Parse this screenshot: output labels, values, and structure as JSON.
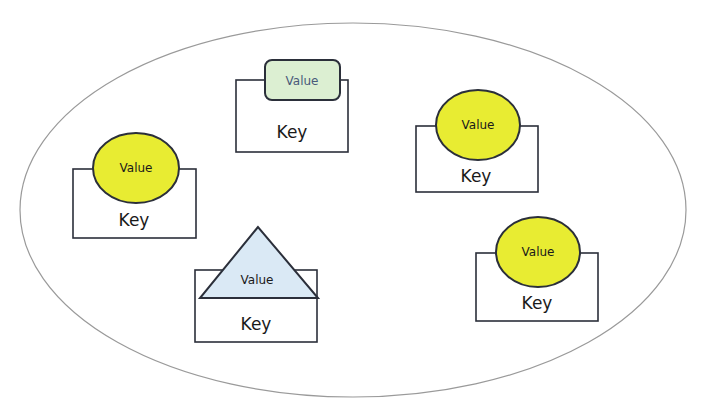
{
  "diagram": {
    "container": {
      "shape": "ellipse",
      "cx": 353,
      "cy": 210,
      "rx": 333,
      "ry": 187,
      "stroke": "#9a9a9a"
    },
    "colors": {
      "circle_fill": "#e8ec32",
      "rounded_rect_fill": "#dcefd2",
      "triangle_fill": "#dae9f5",
      "stroke": "#2b2f3a",
      "box_stroke": "#2b2f3a"
    },
    "nodes": [
      {
        "id": "node-rounded-rect",
        "shape": "rounded-rect",
        "value_label": "Value",
        "key_label": "Key"
      },
      {
        "id": "node-circle-left",
        "shape": "circle",
        "value_label": "Value",
        "key_label": "Key"
      },
      {
        "id": "node-circle-right-top",
        "shape": "circle",
        "value_label": "Value",
        "key_label": "Key"
      },
      {
        "id": "node-triangle",
        "shape": "triangle",
        "value_label": "Value",
        "key_label": "Key"
      },
      {
        "id": "node-circle-right-bottom",
        "shape": "circle",
        "value_label": "Value",
        "key_label": "Key"
      }
    ]
  }
}
